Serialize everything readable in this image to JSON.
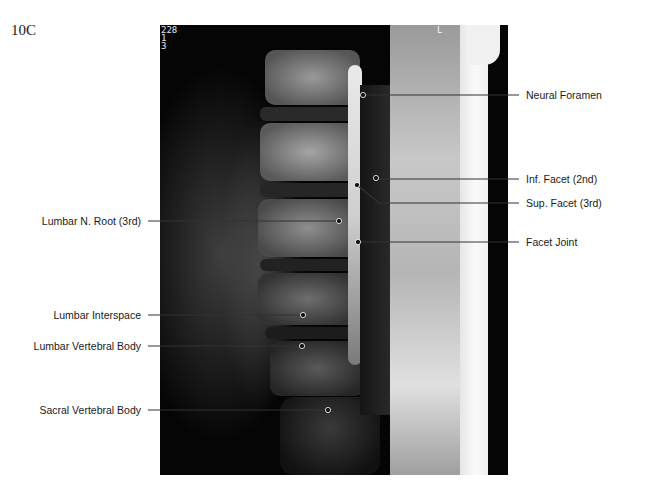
{
  "figure": {
    "id_label": "10C",
    "image_type": "sagittal MRI, lumbar spine",
    "overlay_text": {
      "top_left": [
        "228",
        "1",
        "3"
      ],
      "top_right_marker": "L"
    }
  },
  "labels": {
    "right": [
      {
        "text": "Neural Foramen",
        "dot": [
          363,
          95
        ],
        "line_y": 95
      },
      {
        "text": "Inf. Facet (2nd)",
        "dot": [
          376,
          178
        ],
        "line_y": 179
      },
      {
        "text": "Sup. Facet (3rd)",
        "dot": [
          357,
          185
        ],
        "bend": [
          379,
          203
        ],
        "line_y": 203
      },
      {
        "text": "Facet Joint",
        "dot": [
          358,
          242
        ],
        "line_y": 242
      }
    ],
    "left": [
      {
        "text": "Lumbar N. Root (3rd)",
        "dot": [
          339,
          221
        ],
        "line_y": 221
      },
      {
        "text": "Lumbar Interspace",
        "dot": [
          303,
          315
        ],
        "line_y": 315
      },
      {
        "text": "Lumbar Vertebral Body",
        "dot": [
          302,
          346
        ],
        "line_y": 346
      },
      {
        "text": "Sacral Vertebral Body",
        "dot": [
          328,
          410
        ],
        "line_y": 410
      }
    ]
  },
  "colors": {
    "background": "#ffffff",
    "text": "#1a1a1a",
    "leader_line": "#333333",
    "image_dark": "#050505",
    "image_bright": "#f2f2f2"
  }
}
